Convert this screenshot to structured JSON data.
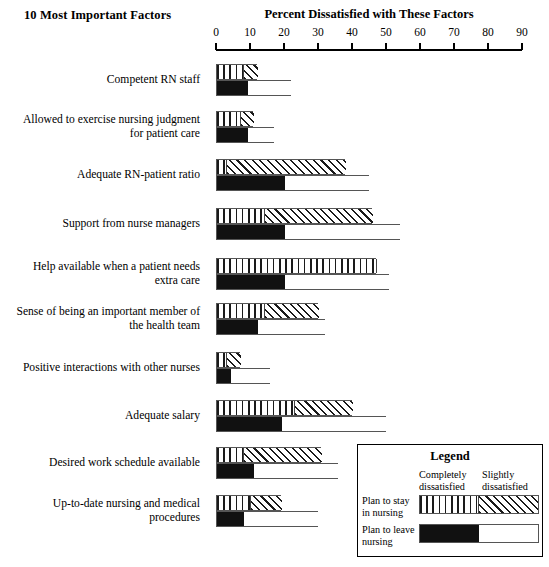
{
  "header": {
    "left_title": "10 Most Important Factors",
    "right_title": "Percent Dissatisfied with These Factors"
  },
  "axis": {
    "ticks": [
      "0",
      "10",
      "20",
      "30",
      "40",
      "50",
      "60",
      "70",
      "80",
      "90"
    ],
    "min": 0,
    "max": 90
  },
  "legend": {
    "title": "Legend",
    "col1": "Completely\ndissatisfied",
    "col1_line1": "Completely",
    "col1_line2": "dissatisfied",
    "col2_line1": "Slightly",
    "col2_line2": "dissatisfied",
    "row1_line1": "Plan to stay",
    "row1_line2": "in nursing",
    "row2_line1": "Plan to leave",
    "row2_line2": "nursing"
  },
  "chart_data": {
    "type": "bar",
    "title": "Percent Dissatisfied with These Factors",
    "subtitle": "10 Most Important Factors",
    "orientation": "horizontal",
    "xlabel": "Percent Dissatisfied with These Factors",
    "ylabel": "10 Most Important Factors",
    "xlim": [
      0,
      90
    ],
    "xticks": [
      0,
      10,
      20,
      30,
      40,
      50,
      60,
      70,
      80,
      90
    ],
    "grid": false,
    "legend_position": "bottom-right",
    "series": [
      {
        "name": "Plan to stay in nursing",
        "segments": [
          "Completely dissatisfied",
          "Slightly dissatisfied"
        ],
        "pattern": [
          "vertical-stripes",
          "diagonal-hatch"
        ]
      },
      {
        "name": "Plan to leave nursing",
        "segments": [
          "Completely dissatisfied",
          "Slightly dissatisfied"
        ],
        "pattern": [
          "solid-black",
          "white"
        ]
      }
    ],
    "categories": [
      "Competent RN staff",
      "Allowed to exercise nursing judgment for patient care",
      "Adequate RN-patient ratio",
      "Support from nurse managers",
      "Help available when a patient needs extra care",
      "Sense of being an important member of the health team",
      "Positive interactions with other nurses",
      "Adequate salary",
      "Desired work schedule available",
      "Up-to-date nursing and medical procedures"
    ],
    "rows": [
      {
        "label_lines": [
          "Competent RN staff"
        ],
        "stay": {
          "completely": 8,
          "slightly": 4,
          "total": 12
        },
        "leave": {
          "completely": 9,
          "slightly": 13,
          "total": 22
        }
      },
      {
        "label_lines": [
          "Allowed to exercise nursing judgment",
          "for patient care"
        ],
        "stay": {
          "completely": 7,
          "slightly": 4,
          "total": 11
        },
        "leave": {
          "completely": 9,
          "slightly": 8,
          "total": 17
        }
      },
      {
        "label_lines": [
          "Adequate RN-patient ratio"
        ],
        "stay": {
          "completely": 3,
          "slightly": 35,
          "total": 38
        },
        "leave": {
          "completely": 20,
          "slightly": 25,
          "total": 45
        }
      },
      {
        "label_lines": [
          "Support from nurse managers"
        ],
        "stay": {
          "completely": 14,
          "slightly": 32,
          "total": 46
        },
        "leave": {
          "completely": 20,
          "slightly": 34,
          "total": 54
        }
      },
      {
        "label_lines": [
          "Help available when a patient needs",
          "extra care"
        ],
        "stay": {
          "completely": 47,
          "slightly": 0,
          "total": 47
        },
        "leave": {
          "completely": 20,
          "slightly": 31,
          "total": 51
        }
      },
      {
        "label_lines": [
          "Sense of being an important member of",
          "the health team"
        ],
        "stay": {
          "completely": 14,
          "slightly": 16,
          "total": 30
        },
        "leave": {
          "completely": 12,
          "slightly": 20,
          "total": 32
        }
      },
      {
        "label_lines": [
          "Positive interactions with other nurses"
        ],
        "stay": {
          "completely": 3,
          "slightly": 4,
          "total": 7
        },
        "leave": {
          "completely": 4,
          "slightly": 12,
          "total": 16
        }
      },
      {
        "label_lines": [
          "Adequate salary"
        ],
        "stay": {
          "completely": 23,
          "slightly": 17,
          "total": 40
        },
        "leave": {
          "completely": 19,
          "slightly": 31,
          "total": 50
        }
      },
      {
        "label_lines": [
          "Desired work schedule available"
        ],
        "stay": {
          "completely": 8,
          "slightly": 23,
          "total": 31
        },
        "leave": {
          "completely": 11,
          "slightly": 25,
          "total": 36
        }
      },
      {
        "label_lines": [
          "Up-to-date nursing and medical",
          "procedures"
        ],
        "stay": {
          "completely": 10,
          "slightly": 9,
          "total": 19
        },
        "leave": {
          "completely": 8,
          "slightly": 22,
          "total": 30
        }
      }
    ]
  },
  "geometry": {
    "axis_x0": 216,
    "axis_x90": 522,
    "row_tops": [
      64,
      111,
      159,
      208,
      258,
      303,
      352,
      400,
      447,
      495
    ]
  }
}
